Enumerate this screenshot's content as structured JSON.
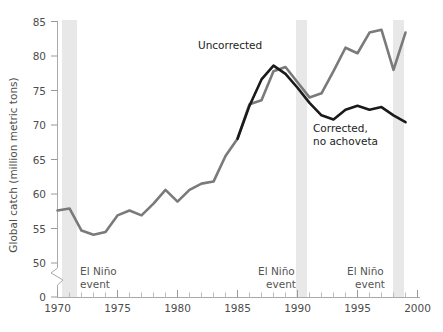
{
  "chart_data": {
    "type": "line",
    "title": "",
    "subtitle": "",
    "xlabel": "",
    "ylabel": "Global catch (million metric tons)",
    "xlim": [
      1970,
      2000
    ],
    "ylim": [
      50,
      85
    ],
    "y_axis_break": true,
    "y_axis_zero_shown": true,
    "grid": false,
    "legend_position": "inline-annotations",
    "x_ticks_major": [
      1970,
      1975,
      1980,
      1985,
      1990,
      1995,
      2000
    ],
    "x_tick_labels": [
      "1970",
      "1975",
      "1980",
      "1985",
      "1990",
      "1995",
      "2000"
    ],
    "x_minor_tick_interval": 1,
    "y_ticks": [
      0,
      50,
      55,
      60,
      65,
      70,
      75,
      80,
      85
    ],
    "y_tick_labels": [
      "0",
      "50",
      "55",
      "60",
      "65",
      "70",
      "75",
      "80",
      "85"
    ],
    "x": [
      1970,
      1971,
      1972,
      1973,
      1974,
      1975,
      1976,
      1977,
      1978,
      1979,
      1980,
      1981,
      1982,
      1983,
      1984,
      1985,
      1986,
      1987,
      1988,
      1989,
      1990,
      1991,
      1992,
      1993,
      1994,
      1995,
      1996,
      1997,
      1998,
      1999
    ],
    "series": [
      {
        "name": "Uncorrected",
        "color": "#7a7a7a",
        "x": [
          1970,
          1971,
          1972,
          1973,
          1974,
          1975,
          1976,
          1977,
          1978,
          1979,
          1980,
          1981,
          1982,
          1983,
          1984,
          1985,
          1986,
          1987,
          1988,
          1989,
          1990,
          1991,
          1992,
          1993,
          1994,
          1995,
          1996,
          1997,
          1998,
          1999
        ],
        "values": [
          57.6,
          57.9,
          54.7,
          54.1,
          54.5,
          56.9,
          57.6,
          56.9,
          58.6,
          60.6,
          58.9,
          60.6,
          61.5,
          61.8,
          65.5,
          68.0,
          73.0,
          73.6,
          77.8,
          78.4,
          76.2,
          74.0,
          74.6,
          77.8,
          81.2,
          80.4,
          83.4,
          83.8,
          78.0,
          83.4
        ]
      },
      {
        "name": "Corrected, no achoveta",
        "color": "#1a1a1a",
        "x": [
          1985,
          1986,
          1987,
          1988,
          1989,
          1990,
          1991,
          1992,
          1993,
          1994,
          1995,
          1996,
          1997,
          1998,
          1999
        ],
        "values": [
          68.0,
          72.8,
          76.6,
          78.6,
          77.4,
          75.4,
          73.2,
          71.4,
          70.8,
          72.2,
          72.8,
          72.2,
          72.6,
          71.4,
          70.4
        ]
      }
    ],
    "annotations": [
      {
        "name": "uncorrected-label",
        "text": "Uncorrected",
        "x": 1985.0,
        "y": 82.0
      },
      {
        "name": "corrected-label-line1",
        "text": "Corrected,",
        "x": 1992.6,
        "y": 67.4
      },
      {
        "name": "corrected-label-line2",
        "text": "no achoveta",
        "x": 1992.6,
        "y": 65.0
      }
    ],
    "shaded_bands": [
      {
        "name": "el-nino-1972",
        "label_line1": "El Niño",
        "label_line2": "event",
        "x_start": 1972.0,
        "x_end": 1973.2,
        "color": "#e8e8e8"
      },
      {
        "name": "el-nino-1991",
        "label_line1": "El Niño",
        "label_line2": "event",
        "x_start": 1990.9,
        "x_end": 1991.8,
        "color": "#e8e8e8"
      },
      {
        "name": "el-nino-1997",
        "label_line1": "El Niño",
        "label_line2": "event",
        "x_start": 1998.0,
        "x_end": 1998.9,
        "color": "#e8e8e8"
      }
    ]
  },
  "axis": {
    "y_title": "Global catch (million metric tons)",
    "y_labels": {
      "t85": "85",
      "t80": "80",
      "t75": "75",
      "t70": "70",
      "t65": "65",
      "t60": "60",
      "t55": "55",
      "t50": "50",
      "t0": "0"
    },
    "x_labels": {
      "x1970": "1970",
      "x1975": "1975",
      "x1980": "1980",
      "x1985": "1985",
      "x1990": "1990",
      "x1995": "1995",
      "x2000": "2000"
    }
  },
  "labels": {
    "uncorrected": "Uncorrected",
    "corrected_line1": "Corrected,",
    "corrected_line2": "no achoveta",
    "el_nino_1": "El Niño",
    "event_1": "event",
    "el_nino_2": "El Niño",
    "event_2": "event",
    "el_nino_3": "El Niño",
    "event_3": "event"
  },
  "colors": {
    "uncorrected": "#7a7a7a",
    "corrected": "#1a1a1a",
    "band": "#e8e8e8",
    "axis": "#aaaaaa",
    "text": "#4d4d4d"
  }
}
